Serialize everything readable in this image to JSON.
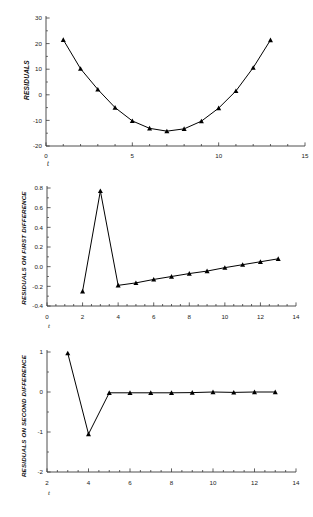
{
  "figure": {
    "background": "#ffffff",
    "line_color": "#000000",
    "marker_color": "#000000",
    "marker": "triangle-up",
    "caption": ""
  },
  "chart_data": [
    {
      "type": "line",
      "id": "residuals",
      "title": "",
      "xlabel": "t",
      "ylabel": "RESIDUALS",
      "xlim": [
        0,
        15
      ],
      "ylim": [
        -20,
        30
      ],
      "xticks": [
        0,
        5,
        10,
        15
      ],
      "xtick_labels": [
        "0",
        "5",
        "10",
        "15"
      ],
      "xminor_step": 1,
      "yticks": [
        -20,
        -10,
        0,
        10,
        20,
        30
      ],
      "ytick_labels": [
        "-20",
        "-10",
        "0",
        "10",
        "20",
        "30"
      ],
      "grid": false,
      "legend": false,
      "x": [
        1,
        2,
        3,
        4,
        5,
        6,
        7,
        8,
        9,
        10,
        11,
        12,
        13
      ],
      "values": [
        21.5,
        10.2,
        2.1,
        -5.0,
        -10.2,
        -13.1,
        -14.2,
        -13.3,
        -10.3,
        -5.2,
        1.5,
        10.6,
        21.4
      ]
    },
    {
      "type": "line",
      "id": "residuals-first-difference",
      "title": "",
      "xlabel": "t",
      "ylabel": "RESIDUALS ON FIRST DIFFERENCE",
      "xlim": [
        0,
        14
      ],
      "ylim": [
        -0.4,
        0.8
      ],
      "xticks": [
        0,
        2,
        4,
        6,
        8,
        10,
        12,
        14
      ],
      "xtick_labels": [
        "0",
        "2",
        "4",
        "6",
        "8",
        "10",
        "12",
        "14"
      ],
      "xminor_step": 0.5,
      "yticks": [
        -0.4,
        -0.2,
        0.0,
        0.2,
        0.4,
        0.6,
        0.8
      ],
      "ytick_labels": [
        "-0.4",
        "-0.2",
        "0.0",
        "0.2",
        "0.4",
        "0.6",
        "0.8"
      ],
      "grid": false,
      "legend": false,
      "x": [
        2,
        3,
        4,
        5,
        6,
        7,
        8,
        9,
        10,
        11,
        12,
        13
      ],
      "values": [
        -0.25,
        0.77,
        -0.19,
        -0.165,
        -0.13,
        -0.1,
        -0.07,
        -0.045,
        -0.01,
        0.02,
        0.05,
        0.08
      ]
    },
    {
      "type": "line",
      "id": "residuals-second-difference",
      "title": "",
      "xlabel": "t",
      "ylabel": "RESIDUALS ON SECOND DIFFERENCE",
      "xlim": [
        2,
        14
      ],
      "ylim": [
        -2,
        1
      ],
      "xticks": [
        2,
        4,
        6,
        8,
        10,
        12,
        14
      ],
      "xtick_labels": [
        "2",
        "4",
        "6",
        "8",
        "10",
        "12",
        "14"
      ],
      "xminor_step": 0.5,
      "yticks": [
        -2,
        -1,
        0,
        1
      ],
      "ytick_labels": [
        "-2",
        "-1",
        "0",
        "1"
      ],
      "grid": false,
      "legend": false,
      "x": [
        3,
        4,
        5,
        6,
        7,
        8,
        9,
        10,
        11,
        12,
        13
      ],
      "values": [
        0.97,
        -1.05,
        -0.02,
        -0.02,
        -0.02,
        -0.02,
        -0.015,
        0.0,
        -0.01,
        0.0,
        0.0
      ]
    }
  ]
}
